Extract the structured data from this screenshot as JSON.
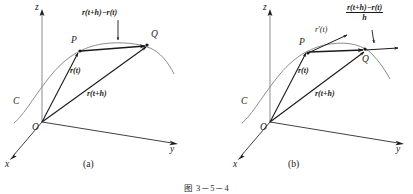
{
  "figure": {
    "caption": "图 3－5－4",
    "background_color": "#ffffff",
    "line_color": "#1a1a1a",
    "curve_color": "#808080"
  },
  "panels": [
    {
      "id": "a",
      "label": "(a)",
      "axes": {
        "z": "z",
        "x": "x",
        "y": "y"
      },
      "points": {
        "origin": "O",
        "p": "P",
        "q": "Q"
      },
      "curve_label": "C",
      "vectors": {
        "r_t": "r(t)",
        "r_t_h": "r(t+h)",
        "difference": "r(t+h)−r(t)"
      }
    },
    {
      "id": "b",
      "label": "(b)",
      "axes": {
        "z": "z",
        "x": "x",
        "y": "y"
      },
      "points": {
        "origin": "O",
        "p": "P",
        "q": "Q"
      },
      "curve_label": "C",
      "vectors": {
        "r_t": "r(t)",
        "r_t_h": "r(t+h)",
        "derivative": "r′(t)",
        "quotient_numerator": "r(t+h)−r(t)",
        "quotient_denominator": "h"
      }
    }
  ]
}
